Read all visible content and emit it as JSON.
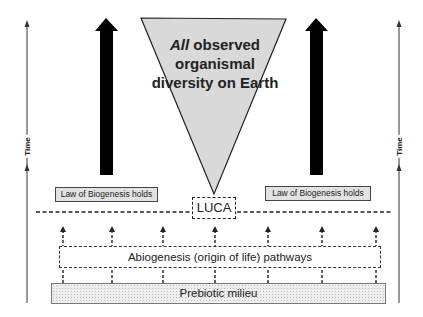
{
  "diagram": {
    "triangle": {
      "label_italic": "All",
      "label_rest": " observed organismal diversity on Earth",
      "fill": "#d9d9d9"
    },
    "law_left": {
      "label": "Law of Biogenesis holds"
    },
    "law_right": {
      "label": "Law of Biogenesis holds"
    },
    "luca": {
      "label": "LUCA"
    },
    "abiogenesis": {
      "label": "Abiogenesis (origin of life) pathways"
    },
    "prebiotic": {
      "label": "Prebiotic milieu"
    },
    "time_left": {
      "label": "Time"
    },
    "time_right": {
      "label": "Time"
    },
    "big_arrows": [
      "evolution-arrow-left",
      "evolution-arrow-right"
    ],
    "pathway_arrow_count": 7
  }
}
